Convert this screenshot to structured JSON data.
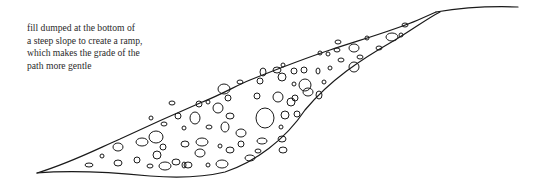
{
  "diagram": {
    "caption_lines": [
      "fill dumped at the bottom of",
      "a steep slope to create a ramp,",
      "which makes the grade of the",
      "path more gentle"
    ],
    "elements": [
      {
        "name": "ground-surface-line",
        "description": "original steep slope leveling off at top right"
      },
      {
        "name": "fill-ramp",
        "description": "wedge of rubble fill with rounded stones"
      }
    ],
    "colors": {
      "line": "#1a1a1a",
      "text": "#2a2a2a",
      "background": "#ffffff"
    }
  }
}
